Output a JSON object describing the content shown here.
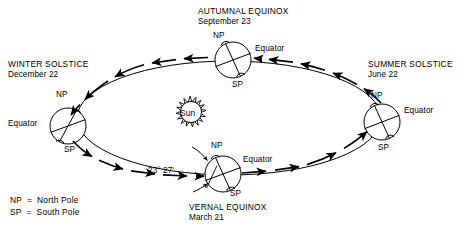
{
  "diagram": {
    "title_semantic": "earth-orbit-seasons-diagram",
    "sun": {
      "label": "Sun"
    },
    "angle_annotation": {
      "value": "23° 27'"
    },
    "positions": [
      {
        "key": "autumnal-equinox",
        "name": "AUTUMNAL EQUINOX",
        "date": "September 23",
        "north_pole": "NP",
        "south_pole": "SP",
        "equator": "Equator"
      },
      {
        "key": "winter-solstice",
        "name": "WINTER SOLSTICE",
        "date": "December 22",
        "north_pole": "NP",
        "south_pole": "SP",
        "equator": "Equator"
      },
      {
        "key": "vernal-equinox",
        "name": "VERNAL EQUINOX",
        "date": "March 21",
        "north_pole": "NP",
        "south_pole": "SP",
        "equator": "Equator"
      },
      {
        "key": "summer-solstice",
        "name": "SUMMER SOLSTICE",
        "date": "June 22",
        "north_pole": "NP",
        "south_pole": "SP",
        "equator": "Equator"
      }
    ],
    "legend": {
      "line1": "NP  =  North Pole",
      "line2": "SP  =  South Pole"
    },
    "colors": {
      "ink": "#000000",
      "background": "#ffffff"
    }
  }
}
